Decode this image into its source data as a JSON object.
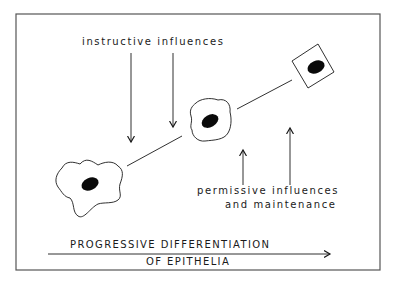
{
  "diagram": {
    "title_axis": {
      "line1": "PROGRESSIVE DIFFERENTIATION",
      "line2": "OF EPITHELIA"
    },
    "labels": {
      "instructive": "instructive  influences",
      "permissive_line1": "permissive  influences",
      "permissive_line2": "and  maintenance"
    },
    "cells": [
      {
        "id": "cell-1",
        "shape": "irregular-amoeboid",
        "stage": "least differentiated"
      },
      {
        "id": "cell-2",
        "shape": "rounded-irregular",
        "stage": "intermediate"
      },
      {
        "id": "cell-3",
        "shape": "square",
        "stage": "most differentiated"
      }
    ],
    "colors": {
      "ink": "#1a1a1a",
      "background": "#ffffff",
      "frame": "#555555"
    }
  }
}
